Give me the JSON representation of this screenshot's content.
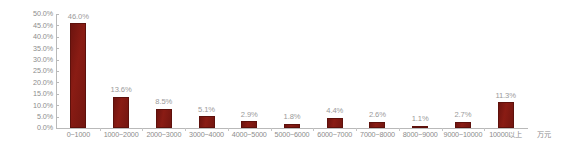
{
  "chart_data": {
    "type": "bar",
    "title": "",
    "xlabel": "万元",
    "ylabel": "",
    "categories": [
      "0~1000",
      "1000~2000",
      "2000~3000",
      "3000~4000",
      "4000~5000",
      "5000~6000",
      "6000~7000",
      "7000~8000",
      "8000~9000",
      "9000~10000",
      "10000以上"
    ],
    "values": [
      46.0,
      13.6,
      8.5,
      5.1,
      2.9,
      1.8,
      4.4,
      2.6,
      1.1,
      2.7,
      11.3
    ],
    "value_labels": [
      "46.0%",
      "13.6%",
      "8.5%",
      "5.1%",
      "2.9%",
      "1.8%",
      "4.4%",
      "2.6%",
      "1.1%",
      "2.7%",
      "11.3%"
    ],
    "ylim": [
      0,
      50
    ],
    "ytick_values": [
      0,
      5,
      10,
      15,
      20,
      25,
      30,
      35,
      40,
      45,
      50
    ],
    "ytick_labels": [
      "0.0%",
      "5.0%",
      "10.0%",
      "15.0%",
      "20.0%",
      "25.0%",
      "30.0%",
      "35.0%",
      "40.0%",
      "45.0%",
      "50.0%"
    ],
    "grid": false,
    "legend": false,
    "bar_color": "#7e1812",
    "axis_color": "#b9b9b9",
    "label_color": "#8c8c8c",
    "background": "#ffffff"
  }
}
